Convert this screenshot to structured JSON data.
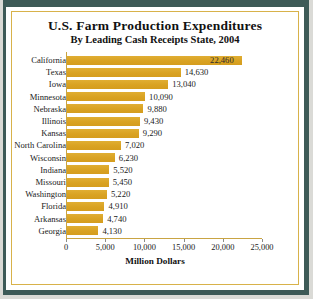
{
  "chart_data": {
    "type": "bar",
    "orientation": "horizontal",
    "title": "U.S. Farm Production Expenditures",
    "subtitle": "By Leading Cash Receipts State, 2004",
    "xlabel": "Million Dollars",
    "ylabel": "",
    "categories": [
      "California",
      "Texas",
      "Iowa",
      "Minnesota",
      "Nebraska",
      "Illinois",
      "Kansas",
      "North Carolina",
      "Wisconsin",
      "Indiana",
      "Missouri",
      "Washington",
      "Florida",
      "Arkansas",
      "Georgia"
    ],
    "values": [
      22460,
      14630,
      13040,
      10090,
      9880,
      9430,
      9290,
      7020,
      6230,
      5520,
      5450,
      5220,
      4910,
      4740,
      4130
    ],
    "value_labels": [
      "22,460",
      "14,630",
      "13,040",
      "10,090",
      "9,880",
      "9,430",
      "9,290",
      "7,020",
      "6,230",
      "5,520",
      "5,450",
      "5,220",
      "4,910",
      "4,740",
      "4,130"
    ],
    "xlim": [
      0,
      25000
    ],
    "xticks": [
      0,
      5000,
      10000,
      15000,
      20000,
      25000
    ],
    "xtick_labels": [
      "0",
      "5,000",
      "10,000",
      "15,000",
      "20,000",
      "25,000"
    ],
    "grid": false,
    "legend": null,
    "bar_color": "#dfa927",
    "axis_color": "#c9a443",
    "frame_color": "#3d5a57",
    "rule_color": "#d8b24a",
    "background": "#ffffff"
  }
}
